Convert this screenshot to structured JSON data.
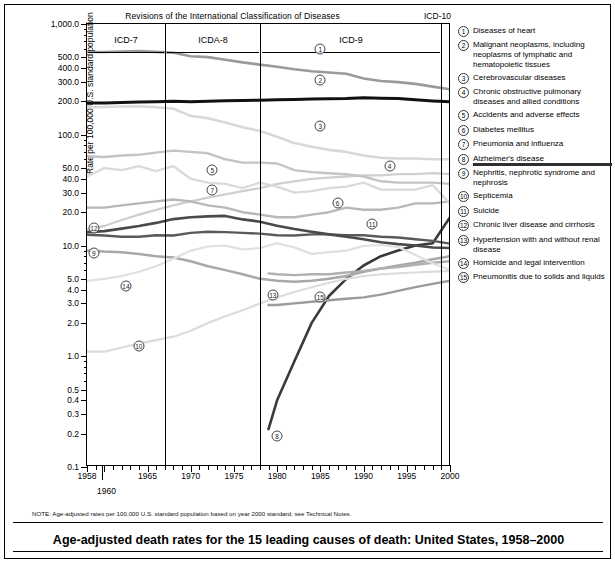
{
  "figure": {
    "revisions_header": "Revisions of the International Classification of Diseases",
    "icd10_label": "ICD-10",
    "note": "NOTE: Age-adjusted rates per 100,000 U.S. standard population based on year 2000 standard; see Technical Notes.",
    "title": "Age-adjusted death rates for the 15 leading causes of death: United States, 1958–2000"
  },
  "axes": {
    "ylabel": "Rate per 100,000 U.S. standard population",
    "ytick_labels": [
      "1,000.0",
      "500.0",
      "400.0",
      "300.0",
      "200.0",
      "100.0",
      "50.0",
      "40.0",
      "30.0",
      "20.0",
      "10.0",
      "5.0",
      "4.0",
      "3.0",
      "2.0",
      "1.0",
      "0.5",
      "0.4",
      "0.3",
      "0.2",
      "0.1"
    ],
    "xtick_labels": [
      "1958",
      "1965",
      "1970",
      "1975",
      "1980",
      "1985",
      "1990",
      "1995",
      "2000"
    ],
    "extra_xlabel": "1960"
  },
  "panels": [
    {
      "label": "ICD-7"
    },
    {
      "label": "ICDA-8"
    },
    {
      "label": "ICD-9"
    },
    {
      "label": "ICD-10"
    }
  ],
  "legend": [
    {
      "num": "1",
      "text": "Diseases of heart",
      "underlined": false
    },
    {
      "num": "2",
      "text": "Malignant neoplasms, including neoplasms of lymphatic and hematopoietic tissues",
      "underlined": false
    },
    {
      "num": "3",
      "text": "Cerebrovascular diseases",
      "underlined": false
    },
    {
      "num": "4",
      "text": "Chronic obstructive pulmonary diseases and allied conditions",
      "underlined": false
    },
    {
      "num": "5",
      "text": "Accidents and adverse effects",
      "underlined": false
    },
    {
      "num": "6",
      "text": "Diabetes mellitus",
      "underlined": false
    },
    {
      "num": "7",
      "text": "Pneumonia and influenza",
      "underlined": false
    },
    {
      "num": "8",
      "text": "Alzheimer's disease",
      "underlined": true
    },
    {
      "num": "9",
      "text": "Nephritis, nephrotic syndrome and nephrosis",
      "underlined": false
    },
    {
      "num": "10",
      "text": "Septicemia",
      "underlined": false
    },
    {
      "num": "11",
      "text": "Suicide",
      "underlined": false
    },
    {
      "num": "12",
      "text": "Chronic liver disease and cirrhosis",
      "underlined": false
    },
    {
      "num": "13",
      "text": "Hypertension with and without renal disease",
      "underlined": false
    },
    {
      "num": "14",
      "text": "Homicide and legal intervention",
      "underlined": false
    },
    {
      "num": "15",
      "text": "Pneumonitis due to solids and liquids",
      "underlined": false
    }
  ],
  "chart_data": {
    "type": "line",
    "title": "Age-adjusted death rates for the 15 leading causes of death: United States, 1958–2000",
    "xlabel": "",
    "ylabel": "Rate per 100,000 U.S. standard population",
    "yscale": "log",
    "ylim": [
      0.1,
      1000.0
    ],
    "xlim": [
      1958,
      2000
    ],
    "grid": false,
    "legend_position": "right",
    "panel_boundaries": [
      1968,
      1979,
      1999
    ],
    "x": [
      1958,
      1960,
      1962,
      1964,
      1966,
      1968,
      1970,
      1972,
      1974,
      1976,
      1978,
      1980,
      1982,
      1984,
      1986,
      1988,
      1990,
      1992,
      1994,
      1996,
      1998,
      2000
    ],
    "series": [
      {
        "name": "Diseases of heart",
        "num": "1",
        "color": "#9a9a9a",
        "width": 2.6,
        "values": [
          559,
          559,
          565,
          570,
          560,
          549,
          512,
          502,
          475,
          450,
          430,
          412,
          390,
          375,
          365,
          355,
          322,
          306,
          299,
          288,
          272,
          258
        ]
      },
      {
        "name": "Malignant neoplasms, including neoplasms of lymphatic and hematopoietic tissues",
        "num": "2",
        "color": "#111111",
        "width": 3.0,
        "values": [
          194,
          194,
          196,
          197,
          199,
          201,
          199,
          201,
          203,
          204,
          205,
          207,
          208,
          210,
          211,
          212,
          216,
          214,
          212,
          207,
          202,
          199
        ]
      },
      {
        "name": "Cerebrovascular diseases",
        "num": "3",
        "color": "#d8d8d8",
        "width": 2.6,
        "values": [
          177,
          178,
          180,
          181,
          177,
          172,
          148,
          141,
          129,
          117,
          108,
          96,
          84,
          78,
          73,
          70,
          65,
          62,
          61,
          61,
          60,
          60
        ]
      },
      {
        "name": "Chronic obstructive pulmonary diseases and allied conditions",
        "num": "4",
        "color": "#cfcfcf",
        "width": 2.3,
        "values": [
          14,
          15,
          17,
          19,
          21,
          23,
          25,
          27,
          29,
          31,
          33,
          36,
          38,
          40,
          41,
          42,
          43,
          43,
          44,
          44,
          45,
          44
        ]
      },
      {
        "name": "Accidents and adverse effects",
        "num": "5",
        "color": "#c4c4c4",
        "width": 2.4,
        "values": [
          64,
          63,
          65,
          66,
          69,
          72,
          70,
          68,
          60,
          56,
          56,
          55,
          48,
          46,
          45,
          44,
          42,
          38,
          37,
          37,
          37,
          36
        ]
      },
      {
        "name": "Diabetes mellitus",
        "num": "6",
        "color": "#b8b8b8",
        "width": 2.4,
        "values": [
          22,
          22,
          23,
          24,
          25,
          26,
          25,
          23,
          22,
          20,
          19,
          18,
          18,
          19,
          20,
          22,
          21,
          21,
          22,
          24,
          24,
          25
        ]
      },
      {
        "name": "Pneumonia and influenza",
        "num": "7",
        "color": "#dadada",
        "width": 2.3,
        "values": [
          42,
          50,
          48,
          52,
          47,
          52,
          40,
          37,
          36,
          33,
          37,
          34,
          30,
          31,
          33,
          34,
          37,
          32,
          32,
          32,
          35,
          24
        ]
      },
      {
        "name": "Alzheimer's disease",
        "num": "8",
        "color": "#3a3a3a",
        "width": 2.6,
        "values": [
          null,
          null,
          null,
          null,
          null,
          null,
          null,
          null,
          null,
          null,
          null,
          0.4,
          0.9,
          2.0,
          3.5,
          5.0,
          6.6,
          8.0,
          9.0,
          10.0,
          10.5,
          18.0
        ],
        "start_year": 1979,
        "start_value": 0.22
      },
      {
        "name": "Nephritis, nephrotic syndrome and nephrosis",
        "num": "9",
        "color": "#a8a8a8",
        "width": 2.5,
        "values": [
          9.0,
          8.8,
          8.7,
          8.4,
          8.0,
          7.8,
          7.2,
          6.5,
          6.0,
          5.5,
          5.0,
          4.8,
          4.7,
          4.8,
          5.0,
          5.3,
          5.8,
          6.2,
          6.6,
          7.0,
          7.5,
          8.0
        ]
      },
      {
        "name": "Septicemia",
        "num": "10",
        "color": "#dcdcdc",
        "width": 2.2,
        "values": [
          1.1,
          1.1,
          1.2,
          1.3,
          1.4,
          1.5,
          1.7,
          2.0,
          2.3,
          2.6,
          3.0,
          3.4,
          3.8,
          4.2,
          4.6,
          5.0,
          5.3,
          5.5,
          5.6,
          5.7,
          5.8,
          5.9
        ]
      },
      {
        "name": "Suicide",
        "num": "11",
        "color": "#5a5a5a",
        "width": 2.4,
        "values": [
          12.5,
          12.3,
          12.0,
          12.0,
          12.4,
          12.3,
          13.0,
          13.3,
          13.2,
          13.0,
          12.8,
          12.4,
          12.3,
          12.6,
          12.6,
          12.4,
          12.4,
          12.0,
          11.8,
          11.4,
          11.0,
          10.4
        ]
      },
      {
        "name": "Chronic liver disease and cirrhosis",
        "num": "12",
        "color": "#4a4a4a",
        "width": 2.6,
        "values": [
          13.2,
          13.5,
          14.2,
          15.0,
          16.0,
          17.3,
          18.0,
          18.3,
          18.5,
          17.2,
          16.4,
          15.1,
          14.1,
          13.3,
          12.6,
          12.0,
          11.4,
          10.7,
          10.3,
          10.0,
          9.6,
          9.5
        ]
      },
      {
        "name": "Hypertension with and without renal disease",
        "num": "13",
        "color": "#b0b0b0",
        "width": 2.4,
        "values": [
          null,
          null,
          null,
          null,
          null,
          null,
          null,
          null,
          null,
          null,
          null,
          5.5,
          5.4,
          5.5,
          5.5,
          5.7,
          5.9,
          6.2,
          6.4,
          6.7,
          7.0,
          7.2
        ],
        "start_year": 1979,
        "start_value": 5.6
      },
      {
        "name": "Homicide and legal intervention",
        "num": "14",
        "color": "#e0e0e0",
        "width": 2.2,
        "values": [
          4.8,
          5.0,
          5.3,
          5.8,
          6.5,
          7.6,
          9.0,
          9.8,
          10.0,
          9.2,
          9.5,
          10.5,
          9.6,
          8.4,
          8.7,
          9.0,
          9.9,
          10.1,
          9.7,
          8.2,
          6.9,
          6.0
        ]
      },
      {
        "name": "Pneumonitis due to solids and liquids",
        "num": "15",
        "color": "#9b9b9b",
        "width": 2.4,
        "values": [
          null,
          null,
          null,
          null,
          null,
          null,
          null,
          null,
          null,
          null,
          null,
          2.9,
          3.0,
          3.1,
          3.2,
          3.3,
          3.4,
          3.6,
          3.9,
          4.2,
          4.5,
          4.8
        ],
        "start_year": 1979,
        "start_value": 2.9
      }
    ],
    "marker_positions": [
      {
        "num": "1",
        "year": 1985,
        "value": 600
      },
      {
        "num": "2",
        "year": 1985,
        "value": 310
      },
      {
        "num": "3",
        "year": 1985,
        "value": 120
      },
      {
        "num": "4",
        "year": 1993,
        "value": 52
      },
      {
        "num": "5",
        "year": 1972.5,
        "value": 48
      },
      {
        "num": "6",
        "year": 1987,
        "value": 24
      },
      {
        "num": "7",
        "year": 1972.5,
        "value": 32
      },
      {
        "num": "8",
        "year": 1980,
        "value": 0.19
      },
      {
        "num": "9",
        "year": 1958.8,
        "value": 8.5
      },
      {
        "num": "10",
        "year": 1964,
        "value": 1.25
      },
      {
        "num": "11",
        "year": 1991,
        "value": 15.5
      },
      {
        "num": "12",
        "year": 1958.8,
        "value": 14.5
      },
      {
        "num": "13",
        "year": 1979.5,
        "value": 3.6
      },
      {
        "num": "14",
        "year": 1962.5,
        "value": 4.3
      },
      {
        "num": "15",
        "year": 1985,
        "value": 3.4
      }
    ]
  }
}
